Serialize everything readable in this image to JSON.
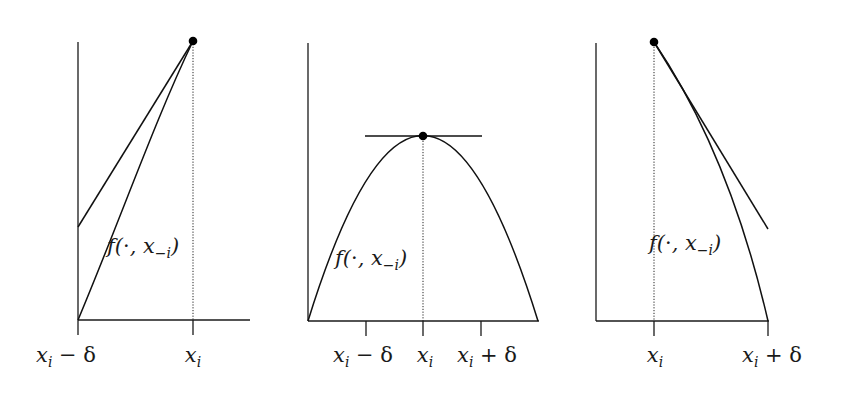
{
  "figure": {
    "panels": [
      {
        "id": "left",
        "description": "function increasing up to x_i; point at right endpoint with chord/support line",
        "curve_label": {
          "base": "f(",
          "dot": "·",
          "sep": ", x",
          "sub": "−i",
          "close": ")"
        },
        "tick_labels": [
          {
            "base": "x",
            "sub": "i",
            "rest": " − δ"
          },
          {
            "base": "x",
            "sub": "i",
            "rest": ""
          }
        ]
      },
      {
        "id": "middle",
        "description": "concave function with interior maximum at x_i and horizontal tangent",
        "curve_label": {
          "base": "f(",
          "dot": "·",
          "sep": ", x",
          "sub": "−i",
          "close": ")"
        },
        "tick_labels": [
          {
            "base": "x",
            "sub": "i",
            "rest": " − δ"
          },
          {
            "base": "x",
            "sub": "i",
            "rest": ""
          },
          {
            "base": "x",
            "sub": "i",
            "rest": " + δ"
          }
        ]
      },
      {
        "id": "right",
        "description": "function decreasing from x_i; point at left endpoint with support line",
        "curve_label": {
          "base": "f(",
          "dot": "·",
          "sep": ", x",
          "sub": "−i",
          "close": ")"
        },
        "tick_labels": [
          {
            "base": "x",
            "sub": "i",
            "rest": ""
          },
          {
            "base": "x",
            "sub": "i",
            "rest": " + δ"
          }
        ]
      }
    ]
  }
}
